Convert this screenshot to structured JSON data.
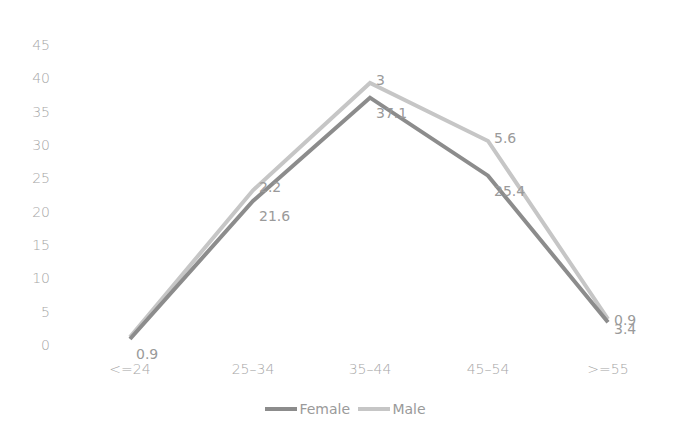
{
  "chart_data": {
    "type": "line",
    "title": "",
    "xlabel": "",
    "ylabel": "",
    "categories": [
      "<=24",
      "25-34",
      "35-44",
      "45-54",
      ">=55"
    ],
    "ylim": [
      0,
      45
    ],
    "yticks": [
      0,
      5,
      10,
      15,
      20,
      25,
      30,
      35,
      40,
      45
    ],
    "grid": false,
    "legend_position": "bottom",
    "series": [
      {
        "name": "Female",
        "color": "#8c8c8c",
        "values": [
          0.9,
          21.6,
          37.1,
          25.4,
          3.4
        ],
        "labels": [
          "0.9",
          "21.6",
          "37.1",
          "25.4",
          "3.4"
        ]
      },
      {
        "name": "Male",
        "color": "#c6c6c6",
        "values": [
          1.2,
          23.2,
          39.3,
          30.6,
          3.9
        ],
        "labels": [
          "",
          "2.2",
          "3",
          "5.6",
          "0.9"
        ]
      }
    ]
  },
  "legend": {
    "female": "Female",
    "male": "Male"
  }
}
